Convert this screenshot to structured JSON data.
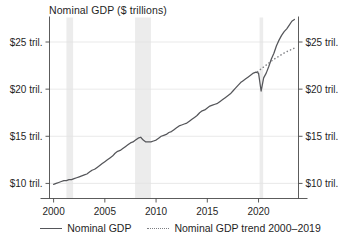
{
  "chart_data": {
    "type": "line",
    "title": "Nominal GDP ($ trillions)",
    "xlabel": "",
    "ylabel": "",
    "xlim": [
      1999.6,
      2023.9
    ],
    "ylim": [
      8.4,
      27.6
    ],
    "grid": true,
    "legend_position": "bottom",
    "xticks": [
      2000,
      2005,
      2010,
      2015,
      2020
    ],
    "xtick_labels": [
      "2000",
      "2005",
      "2010",
      "2015",
      "2020"
    ],
    "yticks": [
      10,
      15,
      20,
      25
    ],
    "ytick_labels": [
      "$10 tril.",
      "$15 tril.",
      "$20 tril.",
      "$25 tril."
    ],
    "ytick_labels_right": [
      "$10 tril.",
      "$15 tril.",
      "$20 tril.",
      "$25 tril."
    ],
    "annotations": [
      {
        "name": "recession-band-2001",
        "x_start": 2001.25,
        "x_end": 2001.9
      },
      {
        "name": "recession-band-2008",
        "x_start": 2007.95,
        "x_end": 2009.5
      },
      {
        "name": "recession-band-2020",
        "x_start": 2020.1,
        "x_end": 2020.45
      }
    ],
    "series": [
      {
        "name": "Nominal GDP",
        "style": "solid",
        "color": "#55565a",
        "x": [
          2000.0,
          2000.25,
          2000.5,
          2000.75,
          2001.0,
          2001.25,
          2001.5,
          2001.75,
          2002.0,
          2002.25,
          2002.5,
          2002.75,
          2003.0,
          2003.25,
          2003.5,
          2003.75,
          2004.0,
          2004.25,
          2004.5,
          2004.75,
          2005.0,
          2005.25,
          2005.5,
          2005.75,
          2006.0,
          2006.25,
          2006.5,
          2006.75,
          2007.0,
          2007.25,
          2007.5,
          2007.75,
          2008.0,
          2008.25,
          2008.5,
          2008.75,
          2009.0,
          2009.25,
          2009.5,
          2009.75,
          2010.0,
          2010.25,
          2010.5,
          2010.75,
          2011.0,
          2011.25,
          2011.5,
          2011.75,
          2012.0,
          2012.25,
          2012.5,
          2012.75,
          2013.0,
          2013.25,
          2013.5,
          2013.75,
          2014.0,
          2014.25,
          2014.5,
          2014.75,
          2015.0,
          2015.25,
          2015.5,
          2015.75,
          2016.0,
          2016.25,
          2016.5,
          2016.75,
          2017.0,
          2017.25,
          2017.5,
          2017.75,
          2018.0,
          2018.25,
          2018.5,
          2018.75,
          2019.0,
          2019.25,
          2019.5,
          2019.75,
          2020.0,
          2020.25,
          2020.5,
          2020.75,
          2021.0,
          2021.25,
          2021.5,
          2021.75,
          2022.0,
          2022.25,
          2022.5,
          2022.75,
          2023.0,
          2023.25,
          2023.5
        ],
        "values": [
          9.9,
          10.0,
          10.1,
          10.2,
          10.3,
          10.3,
          10.4,
          10.4,
          10.5,
          10.6,
          10.7,
          10.8,
          10.9,
          11.0,
          11.2,
          11.4,
          11.5,
          11.7,
          11.9,
          12.1,
          12.3,
          12.5,
          12.7,
          12.9,
          13.2,
          13.4,
          13.5,
          13.7,
          13.9,
          14.1,
          14.3,
          14.4,
          14.6,
          14.8,
          14.9,
          14.6,
          14.4,
          14.4,
          14.4,
          14.5,
          14.6,
          14.8,
          15.0,
          15.1,
          15.2,
          15.4,
          15.5,
          15.7,
          15.9,
          16.1,
          16.2,
          16.3,
          16.4,
          16.6,
          16.8,
          17.0,
          17.2,
          17.5,
          17.7,
          17.8,
          18.0,
          18.2,
          18.3,
          18.4,
          18.5,
          18.7,
          18.9,
          19.1,
          19.3,
          19.5,
          19.8,
          20.1,
          20.4,
          20.7,
          20.9,
          21.1,
          21.3,
          21.5,
          21.7,
          21.8,
          21.7,
          19.8,
          21.2,
          21.7,
          22.4,
          23.2,
          23.8,
          24.6,
          25.2,
          25.7,
          26.1,
          26.4,
          26.8,
          27.2,
          27.4
        ]
      },
      {
        "name": "Nominal GDP trend 2000–2019",
        "style": "dotted",
        "color": "#7d7e82",
        "x": [
          2019.9,
          2020.2,
          2020.5,
          2020.8,
          2021.1,
          2021.4,
          2021.7,
          2022.0,
          2022.3,
          2022.6,
          2022.9,
          2023.2,
          2023.5
        ],
        "values": [
          21.85,
          22.1,
          22.35,
          22.6,
          22.85,
          23.1,
          23.3,
          23.5,
          23.7,
          23.9,
          24.05,
          24.2,
          24.35
        ]
      }
    ]
  },
  "legend": {
    "items": [
      {
        "label": "Nominal GDP",
        "style": "solid"
      },
      {
        "label": "Nominal GDP trend 2000–2019",
        "style": "dotted"
      }
    ]
  }
}
